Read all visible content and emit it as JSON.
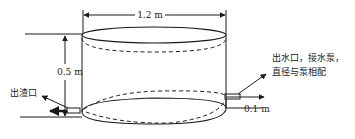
{
  "diagram": {
    "type": "cylindrical tank schematic",
    "labels": {
      "diameter": "1.2 m",
      "height": "0.5 m",
      "outlet_height": "0.1 m",
      "slag_outlet": "出渣口",
      "water_outlet_line1": "出水口，接水泵，",
      "water_outlet_line2": "直径与泵相配"
    },
    "colors": {
      "line": "#1a1a1a",
      "background": "#ffffff"
    }
  }
}
